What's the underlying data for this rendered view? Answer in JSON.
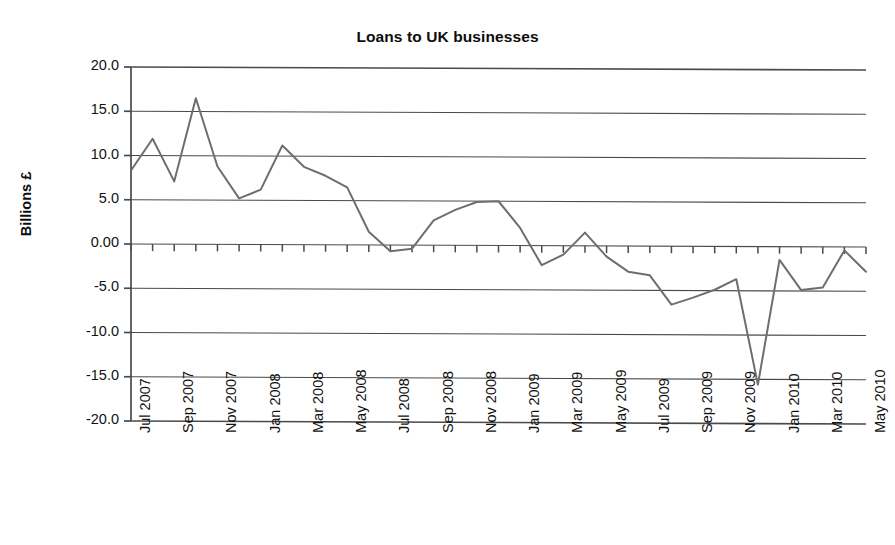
{
  "chart_data": {
    "type": "line",
    "title": "Loans to UK businesses",
    "xlabel": "",
    "ylabel": "Billions £",
    "ylim": [
      -20.0,
      20.0
    ],
    "ytick_labels": [
      "20.0",
      "15.0",
      "10.0",
      "5.0",
      "0.00",
      "-5.0",
      "-10.0",
      "-15.0",
      "-20.0"
    ],
    "ytick_values": [
      20,
      15,
      10,
      5,
      0,
      -5,
      -10,
      -15,
      -20
    ],
    "grid": "horizontal",
    "legend": "none",
    "line_color": "#6e6e6e",
    "axis_color": "#4a4a4a",
    "x": [
      "Jul 2007",
      "Aug 2007",
      "Sep 2007",
      "Oct 2007",
      "Nov 2007",
      "Dec 2007",
      "Jan 2008",
      "Feb 2008",
      "Mar 2008",
      "Apr 2008",
      "May 2008",
      "Jun 2008",
      "Jul 2008",
      "Aug 2008",
      "Sep 2008",
      "Oct 2008",
      "Nov 2008",
      "Dec 2008",
      "Jan 2009",
      "Feb 2009",
      "Mar 2009",
      "Apr 2009",
      "May 2009",
      "Jun 2009",
      "Jul 2009",
      "Aug 2009",
      "Sep 2009",
      "Oct 2009",
      "Nov 2009",
      "Dec 2009",
      "Jan 2010",
      "Feb 2010",
      "Mar 2010",
      "Apr 2010",
      "May 2010"
    ],
    "xtick_labels": [
      "Jul 2007",
      "Sep 2007",
      "Nov 2007",
      "Jan 2008",
      "Mar 2008",
      "May 2008",
      "Jul 2008",
      "Sep 2008",
      "Nov 2008",
      "Jan 2009",
      "Mar 2009",
      "May 2009",
      "Jul 2009",
      "Sep 2009",
      "Nov 2009",
      "Jan 2010",
      "Mar 2010",
      "May 2010"
    ],
    "values": [
      8.3,
      11.9,
      7.1,
      16.5,
      8.8,
      5.2,
      6.2,
      11.2,
      8.8,
      7.8,
      6.5,
      1.5,
      -0.7,
      -0.4,
      2.8,
      4.0,
      4.9,
      5.0,
      2.0,
      -2.2,
      -1.0,
      1.5,
      -1.2,
      -2.9,
      -3.3,
      -6.6,
      -5.8,
      -4.9,
      -3.7,
      -15.6,
      -1.5,
      -4.9,
      -4.6,
      -0.4,
      -2.8
    ],
    "series": [
      {
        "name": "Loans to UK businesses",
        "values": [
          8.3,
          11.9,
          7.1,
          16.5,
          8.8,
          5.2,
          6.2,
          11.2,
          8.8,
          7.8,
          6.5,
          1.5,
          -0.7,
          -0.4,
          2.8,
          4.0,
          4.9,
          5.0,
          2.0,
          -2.2,
          -1.0,
          1.5,
          -1.2,
          -2.9,
          -3.3,
          -6.6,
          -5.8,
          -4.9,
          -3.7,
          -15.6,
          -1.5,
          -4.9,
          -4.6,
          -0.4,
          -2.8
        ]
      }
    ],
    "extended_points": [
      {
        "label": "Jan 2010",
        "value": -7.1
      },
      {
        "label": "Mar 2010",
        "value": -0.3
      },
      {
        "label": "Apr 2010",
        "value": -4.6
      },
      {
        "label": "May 2010",
        "value": -1.8
      }
    ]
  }
}
